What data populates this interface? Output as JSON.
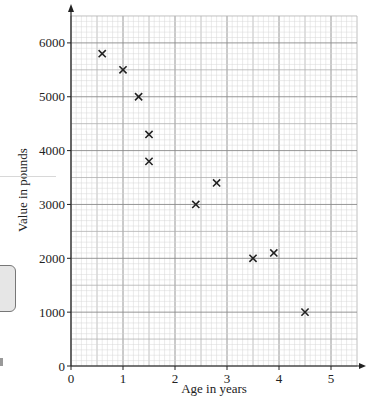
{
  "chart_data": {
    "type": "scatter",
    "title": "",
    "xlabel": "Age in years",
    "ylabel": "Value in pounds",
    "xlim": [
      0,
      5.5
    ],
    "ylim": [
      0,
      6500
    ],
    "x_ticks": [
      0,
      1,
      2,
      3,
      4,
      5
    ],
    "y_ticks": [
      0,
      1000,
      2000,
      3000,
      4000,
      5000,
      6000
    ],
    "x_tick_labels": [
      "0",
      "1",
      "2",
      "3",
      "4",
      "5"
    ],
    "y_tick_labels": [
      "0",
      "1000",
      "2000",
      "3000",
      "4000",
      "5000",
      "6000"
    ],
    "grid": true,
    "grid_major_x": 0.5,
    "grid_minor_x": 0.1,
    "grid_major_y": 500,
    "grid_minor_y": 100,
    "marker": "x",
    "legend": null,
    "series": [
      {
        "name": "Cars",
        "points": [
          {
            "x": 0.6,
            "y": 5800
          },
          {
            "x": 1.0,
            "y": 5500
          },
          {
            "x": 1.3,
            "y": 5000
          },
          {
            "x": 1.5,
            "y": 4300
          },
          {
            "x": 1.5,
            "y": 3800
          },
          {
            "x": 2.4,
            "y": 3000
          },
          {
            "x": 2.8,
            "y": 3400
          },
          {
            "x": 3.5,
            "y": 2000
          },
          {
            "x": 3.9,
            "y": 2100
          },
          {
            "x": 4.5,
            "y": 1000
          }
        ]
      }
    ]
  },
  "colors": {
    "axis": "#222222",
    "grid_major": "#8a8a8a",
    "grid_mid": "#b0b0b0",
    "grid_minor": "#d6d6d6",
    "marker": "#222222"
  }
}
